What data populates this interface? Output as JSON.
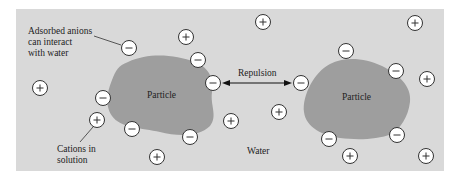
{
  "diagram": {
    "colors": {
      "page_background": "#ffffff",
      "water_background": "#d9d9d9",
      "particle_fill": "#9e9e9e",
      "ion_fill": "#ffffff",
      "ion_stroke": "#333333",
      "text": "#222222"
    },
    "labels": {
      "adsorbed_anions_line1": "Adsorbed anions",
      "adsorbed_anions_line2": "can interact",
      "adsorbed_anions_line3": "with water",
      "cations_line1": "Cations in",
      "cations_line2": "solution",
      "repulsion": "Repulsion",
      "water": "Water",
      "particle_left": "Particle",
      "particle_right": "Particle"
    },
    "ion_symbols": {
      "anion": "−",
      "cation": "+"
    },
    "anions": [
      {
        "x": 129,
        "y": 48
      },
      {
        "x": 198,
        "y": 60
      },
      {
        "x": 213,
        "y": 83
      },
      {
        "x": 103,
        "y": 98
      },
      {
        "x": 132,
        "y": 129
      },
      {
        "x": 190,
        "y": 137
      },
      {
        "x": 301,
        "y": 83
      },
      {
        "x": 346,
        "y": 51
      },
      {
        "x": 396,
        "y": 71
      },
      {
        "x": 329,
        "y": 139
      },
      {
        "x": 397,
        "y": 135
      }
    ],
    "cations": [
      {
        "x": 186,
        "y": 37
      },
      {
        "x": 263,
        "y": 22
      },
      {
        "x": 415,
        "y": 23
      },
      {
        "x": 40,
        "y": 88
      },
      {
        "x": 97,
        "y": 120
      },
      {
        "x": 231,
        "y": 121
      },
      {
        "x": 157,
        "y": 157
      },
      {
        "x": 279,
        "y": 112
      },
      {
        "x": 427,
        "y": 79
      },
      {
        "x": 350,
        "y": 156
      },
      {
        "x": 426,
        "y": 156
      }
    ]
  }
}
